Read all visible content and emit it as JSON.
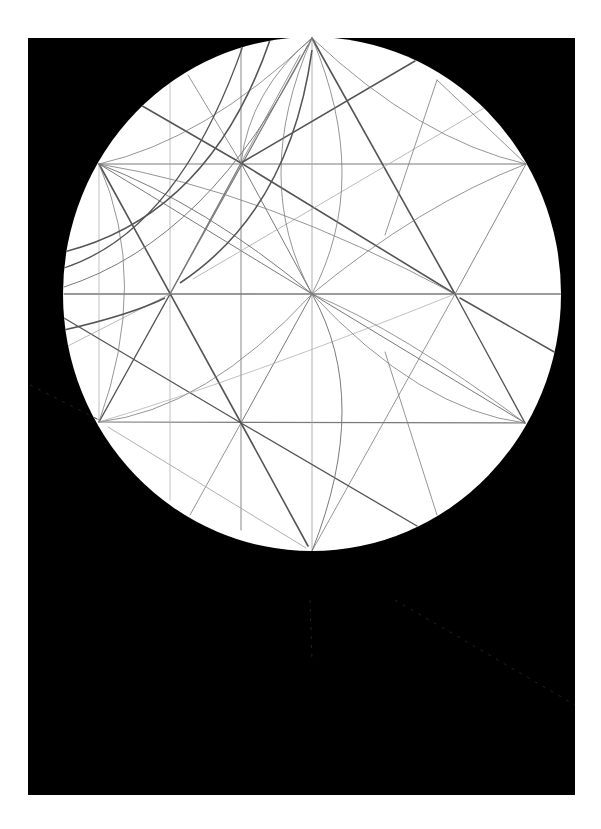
{
  "figure": {
    "colors": {
      "page": "#ffffff",
      "background_rect": "#000000",
      "disc": "#ffffff",
      "line_dark": "#555555",
      "line_mid": "#7a7a7a",
      "line_light": "#a8a8a8"
    },
    "background_rect": {
      "x": 28,
      "y": 38,
      "w": 547,
      "h": 757
    },
    "circle": {
      "cx": 312,
      "cy": 294,
      "rx": 249,
      "ry": 257
    },
    "points": {
      "top": [
        312,
        38
      ],
      "bottom": [
        312,
        551
      ],
      "upper_left": [
        99,
        164
      ],
      "upper_right": [
        526,
        164
      ],
      "lower_left": [
        99,
        422
      ],
      "lower_right": [
        525,
        423
      ],
      "center": [
        312,
        294
      ],
      "left_node": [
        170,
        294
      ],
      "right_node": [
        455,
        294
      ],
      "ul_node": [
        241,
        163
      ],
      "ll_node": [
        241,
        423
      ]
    },
    "lines": [
      {
        "x1": 99,
        "y1": 164,
        "x2": 526,
        "y2": 164,
        "w": 1.2,
        "c": "line_mid"
      },
      {
        "x1": 64,
        "y1": 294,
        "x2": 561,
        "y2": 294,
        "w": 1.4,
        "c": "line_mid"
      },
      {
        "x1": 99,
        "y1": 422,
        "x2": 525,
        "y2": 423,
        "w": 1.2,
        "c": "line_mid"
      },
      {
        "x1": 312,
        "y1": 38,
        "x2": 312,
        "y2": 551,
        "w": 0.9,
        "c": "line_light"
      },
      {
        "x1": 241,
        "y1": 40,
        "x2": 241,
        "y2": 530,
        "w": 0.9,
        "c": "line_mid"
      },
      {
        "x1": 170,
        "y1": 42,
        "x2": 170,
        "y2": 500,
        "w": 0.7,
        "c": "line_light"
      },
      {
        "x1": 99,
        "y1": 164,
        "x2": 99,
        "y2": 422,
        "w": 0.7,
        "c": "line_light"
      },
      {
        "x1": 312,
        "y1": 38,
        "x2": 170,
        "y2": 294,
        "w": 1.2,
        "c": "line_mid"
      },
      {
        "x1": 312,
        "y1": 38,
        "x2": 455,
        "y2": 294,
        "w": 1.6,
        "c": "line_dark"
      },
      {
        "x1": 99,
        "y1": 164,
        "x2": 241,
        "y2": 423,
        "w": 1.6,
        "c": "line_dark"
      },
      {
        "x1": 99,
        "y1": 422,
        "x2": 170,
        "y2": 294,
        "w": 1.4,
        "c": "line_dark"
      },
      {
        "x1": 170,
        "y1": 294,
        "x2": 241,
        "y2": 163,
        "w": 1.2,
        "c": "line_mid"
      },
      {
        "x1": 241,
        "y1": 163,
        "x2": 455,
        "y2": 294,
        "w": 1.6,
        "c": "line_dark"
      },
      {
        "x1": 455,
        "y1": 294,
        "x2": 525,
        "y2": 423,
        "w": 1.4,
        "c": "line_dark"
      },
      {
        "x1": 455,
        "y1": 294,
        "x2": 526,
        "y2": 164,
        "w": 0.9,
        "c": "line_mid"
      },
      {
        "x1": 312,
        "y1": 294,
        "x2": 241,
        "y2": 423,
        "w": 1.0,
        "c": "line_mid"
      },
      {
        "x1": 312,
        "y1": 294,
        "x2": 525,
        "y2": 423,
        "w": 1.0,
        "c": "line_mid"
      },
      {
        "x1": 241,
        "y1": 423,
        "x2": 308,
        "y2": 546,
        "w": 1.6,
        "c": "line_dark"
      },
      {
        "x1": 241,
        "y1": 423,
        "x2": 190,
        "y2": 515,
        "w": 0.8,
        "c": "line_mid"
      },
      {
        "x1": 312,
        "y1": 551,
        "x2": 455,
        "y2": 294,
        "w": 0.8,
        "c": "line_mid"
      },
      {
        "x1": 312,
        "y1": 294,
        "x2": 241,
        "y2": 163,
        "w": 1.0,
        "c": "line_mid"
      },
      {
        "x1": 312,
        "y1": 294,
        "x2": 99,
        "y2": 164,
        "w": 1.0,
        "c": "line_mid"
      },
      {
        "x1": 125,
        "y1": 96,
        "x2": 241,
        "y2": 163,
        "w": 1.5,
        "c": "line_dark"
      },
      {
        "x1": 241,
        "y1": 163,
        "x2": 415,
        "y2": 61,
        "w": 1.5,
        "c": "line_dark"
      },
      {
        "x1": 64,
        "y1": 318,
        "x2": 241,
        "y2": 423,
        "w": 1.3,
        "c": "line_dark"
      },
      {
        "x1": 241,
        "y1": 423,
        "x2": 417,
        "y2": 526,
        "w": 1.3,
        "c": "line_dark"
      },
      {
        "x1": 460,
        "y1": 298,
        "x2": 556,
        "y2": 353,
        "w": 1.5,
        "c": "line_dark"
      },
      {
        "x1": 108,
        "y1": 427,
        "x2": 306,
        "y2": 548,
        "w": 0.9,
        "c": "line_light"
      },
      {
        "x1": 64,
        "y1": 348,
        "x2": 170,
        "y2": 294,
        "w": 0.8,
        "c": "line_light"
      },
      {
        "x1": 193,
        "y1": 279,
        "x2": 484,
        "y2": 108,
        "w": 0.8,
        "c": "line_light"
      },
      {
        "x1": 188,
        "y1": 75,
        "x2": 241,
        "y2": 163,
        "w": 0.8,
        "c": "line_mid"
      },
      {
        "x1": 241,
        "y1": 163,
        "x2": 300,
        "y2": 55,
        "w": 0.8,
        "c": "line_mid"
      },
      {
        "x1": 526,
        "y1": 164,
        "x2": 437,
        "y2": 80,
        "w": 0.8,
        "c": "line_mid"
      },
      {
        "x1": 385,
        "y1": 235,
        "x2": 437,
        "y2": 80,
        "w": 0.8,
        "c": "line_mid"
      },
      {
        "x1": 385,
        "y1": 352,
        "x2": 437,
        "y2": 515,
        "w": 0.8,
        "c": "line_mid"
      },
      {
        "x1": 30,
        "y1": 385,
        "x2": 99,
        "y2": 420,
        "w": 0.8,
        "c": "line_mid"
      }
    ],
    "arcs": [
      {
        "d": "M 99 164 Q 205 205 312 294",
        "w": 1.0,
        "c": "line_mid"
      },
      {
        "d": "M 99 164 Q 260 190 455 294",
        "w": 0.8,
        "c": "line_mid"
      },
      {
        "d": "M 526 164 Q 420 140 312 38",
        "w": 0.8,
        "c": "line_mid"
      },
      {
        "d": "M 99 164 Q 205 140 312 38",
        "w": 0.8,
        "c": "line_mid"
      },
      {
        "d": "M 526 164 Q 420 205 312 294",
        "w": 0.8,
        "c": "line_mid"
      },
      {
        "d": "M 99 422 Q 205 410 312 294",
        "w": 0.8,
        "c": "line_mid"
      },
      {
        "d": "M 525 423 Q 420 410 312 294",
        "w": 0.8,
        "c": "line_mid"
      },
      {
        "d": "M 99 422 Q 240 380 455 294",
        "w": 0.7,
        "c": "line_light"
      },
      {
        "d": "M 312 294 Q 372 400 312 551",
        "w": 1.0,
        "c": "line_mid"
      },
      {
        "d": "M 312 38 Q 372 180 312 294",
        "w": 0.8,
        "c": "line_mid"
      },
      {
        "d": "M 312 38 Q 250 180 312 294",
        "w": 0.8,
        "c": "line_mid"
      },
      {
        "d": "M 99 164 Q 150 280 99 422",
        "w": 0.8,
        "c": "line_mid"
      },
      {
        "d": "M 64 252 Q 210 215 270 40",
        "w": 1.6,
        "c": "line_dark"
      },
      {
        "d": "M 64 268 Q 180 230 245 40",
        "w": 1.3,
        "c": "line_dark"
      },
      {
        "d": "M 64 287 Q 210 240 308 45",
        "w": 1.0,
        "c": "line_mid"
      },
      {
        "d": "M 180 283 Q 290 210 312 50",
        "w": 1.6,
        "c": "line_dark"
      },
      {
        "d": "M 64 330 Q 130 315 165 298",
        "w": 1.5,
        "c": "line_dark"
      },
      {
        "d": "M 312 294 Q 400 330 525 423",
        "w": 0.8,
        "c": "line_mid"
      },
      {
        "d": "M 312 38 Q 250 90 241 163",
        "w": 0.8,
        "c": "line_mid"
      }
    ]
  }
}
